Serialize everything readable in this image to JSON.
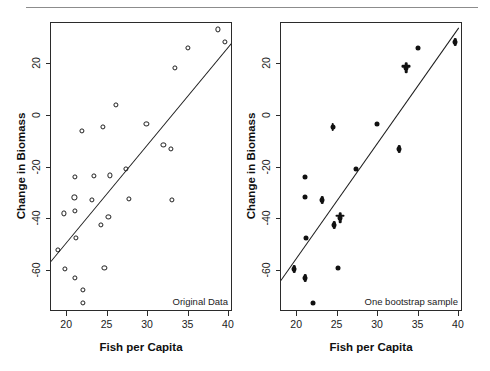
{
  "figure": {
    "background_color": "#ffffff",
    "rule_color": "#8c8c8c",
    "axis_color": "#2b2b2b",
    "marker_color": "#111111",
    "line_color": "#1c1c1c"
  },
  "chart_data": [
    {
      "type": "scatter",
      "panel": "left",
      "title": "",
      "annotation": "Original Data",
      "xlabel": "Fish per Capita",
      "ylabel": "Change in Biomass",
      "xlim": [
        18.0,
        40.5
      ],
      "ylim": [
        -76.0,
        36.0
      ],
      "xticks": [
        20,
        25,
        30,
        35,
        40
      ],
      "yticks": [
        20,
        0,
        -20,
        -40,
        -60
      ],
      "xticklabels": [
        "20",
        "25",
        "30",
        "35",
        "40"
      ],
      "yticklabels": [
        "20",
        "0",
        "-20",
        "-40",
        "-60"
      ],
      "grid": false,
      "legend": false,
      "marker_style": "open-circle",
      "points": [
        {
          "x": 18.9,
          "y": -52.0
        },
        {
          "x": 19.6,
          "y": -37.8
        },
        {
          "x": 19.7,
          "y": -59.4
        },
        {
          "x": 20.9,
          "y": -31.6
        },
        {
          "x": 21.0,
          "y": -23.7
        },
        {
          "x": 21.0,
          "y": -36.9
        },
        {
          "x": 21.0,
          "y": -62.8
        },
        {
          "x": 21.1,
          "y": -47.4
        },
        {
          "x": 21.8,
          "y": -5.9
        },
        {
          "x": 21.9,
          "y": -67.5
        },
        {
          "x": 21.9,
          "y": -72.5
        },
        {
          "x": 23.1,
          "y": -32.6
        },
        {
          "x": 23.3,
          "y": -23.2
        },
        {
          "x": 24.2,
          "y": -42.2
        },
        {
          "x": 24.4,
          "y": -4.2
        },
        {
          "x": 24.6,
          "y": -58.9
        },
        {
          "x": 25.1,
          "y": -39.2
        },
        {
          "x": 25.3,
          "y": -23.1
        },
        {
          "x": 26.0,
          "y": 4.4
        },
        {
          "x": 27.3,
          "y": -20.7
        },
        {
          "x": 27.6,
          "y": -32.2
        },
        {
          "x": 29.8,
          "y": -3.0
        },
        {
          "x": 31.9,
          "y": -11.4
        },
        {
          "x": 32.8,
          "y": -12.8
        },
        {
          "x": 32.9,
          "y": -32.7
        },
        {
          "x": 33.3,
          "y": 18.5
        },
        {
          "x": 34.9,
          "y": 26.5
        },
        {
          "x": 38.6,
          "y": 33.5
        },
        {
          "x": 39.5,
          "y": 28.7
        }
      ],
      "fitline": {
        "x0": 18.0,
        "y0": -56.2,
        "x1": 40.4,
        "y1": 28.6
      }
    },
    {
      "type": "scatter",
      "panel": "right",
      "title": "",
      "annotation": "One bootstrap sample",
      "xlabel": "Fish per Capita",
      "ylabel": "Change in Biomass",
      "xlim": [
        18.0,
        40.5
      ],
      "ylim": [
        -76.0,
        36.0
      ],
      "xticks": [
        20,
        25,
        30,
        35,
        40
      ],
      "yticks": [
        20,
        0,
        -20,
        -40,
        -60
      ],
      "xticklabels": [
        "20",
        "25",
        "30",
        "35",
        "40"
      ],
      "yticklabels": [
        "20",
        "0",
        "-20",
        "-40",
        "-60"
      ],
      "grid": false,
      "legend": false,
      "marker_style": "filled-circle",
      "points": [
        {
          "x": 19.6,
          "y": -59.4,
          "multiplicity": 2
        },
        {
          "x": 21.0,
          "y": -23.7,
          "multiplicity": 1
        },
        {
          "x": 21.0,
          "y": -31.6,
          "multiplicity": 1
        },
        {
          "x": 21.0,
          "y": -62.8,
          "multiplicity": 2
        },
        {
          "x": 21.1,
          "y": -47.4,
          "multiplicity": 1
        },
        {
          "x": 21.9,
          "y": -72.5,
          "multiplicity": 1
        },
        {
          "x": 23.1,
          "y": -32.6,
          "multiplicity": 2
        },
        {
          "x": 24.4,
          "y": -4.2,
          "multiplicity": 2
        },
        {
          "x": 24.6,
          "y": -42.2,
          "multiplicity": 2
        },
        {
          "x": 25.1,
          "y": -58.9,
          "multiplicity": 1
        },
        {
          "x": 25.3,
          "y": -39.4,
          "multiplicity": 3
        },
        {
          "x": 27.3,
          "y": -20.7,
          "multiplicity": 1
        },
        {
          "x": 29.9,
          "y": -3.1,
          "multiplicity": 1
        },
        {
          "x": 32.6,
          "y": -12.8,
          "multiplicity": 2
        },
        {
          "x": 33.5,
          "y": 18.6,
          "multiplicity": 3
        },
        {
          "x": 34.9,
          "y": 26.5,
          "multiplicity": 1
        },
        {
          "x": 39.5,
          "y": 28.7,
          "multiplicity": 2
        }
      ],
      "fitline": {
        "x0": 18.0,
        "y0": -63.5,
        "x1": 40.0,
        "y1": 34.5
      }
    }
  ]
}
